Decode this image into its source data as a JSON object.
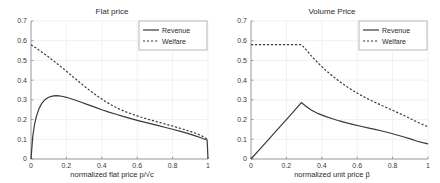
{
  "figure": {
    "background": "#ffffff",
    "line_color": "#3a3a3a",
    "grid_color": "#e8e8e8",
    "axis_color": "#8c8c8c"
  },
  "chart_data": [
    {
      "type": "line",
      "title": "Flat price",
      "xlabel": "normalized flat price p/√c",
      "ylabel": "",
      "xlim": [
        0,
        1
      ],
      "ylim": [
        0,
        0.7
      ],
      "xticks": [
        0,
        0.2,
        0.4,
        0.6,
        0.8,
        1
      ],
      "xticklabels": [
        "0",
        "0.2",
        "0.4",
        "0.6",
        "0.8",
        "1"
      ],
      "yticks": [
        0,
        0.1,
        0.2,
        0.3,
        0.4,
        0.5,
        0.6,
        0.7
      ],
      "yticklabels": [
        "0",
        "0.1",
        "0.2",
        "0.3",
        "0.4",
        "0.5",
        "0.6",
        "0.7"
      ],
      "grid": true,
      "legend_position": "upper right",
      "series": [
        {
          "name": "Revenue",
          "style": "solid",
          "x": [
            0.0,
            0.01,
            0.02,
            0.03,
            0.045,
            0.06,
            0.08,
            0.1,
            0.12,
            0.14,
            0.16,
            0.18,
            0.2,
            0.24,
            0.28,
            0.32,
            0.36,
            0.4,
            0.44,
            0.48,
            0.52,
            0.56,
            0.6,
            0.64,
            0.68,
            0.72,
            0.76,
            0.8,
            0.84,
            0.88,
            0.92,
            0.96,
            0.985,
            0.995,
            1.0
          ],
          "y": [
            0.0,
            0.115,
            0.175,
            0.215,
            0.255,
            0.281,
            0.302,
            0.313,
            0.319,
            0.321,
            0.32,
            0.317,
            0.313,
            0.302,
            0.289,
            0.276,
            0.263,
            0.25,
            0.238,
            0.227,
            0.216,
            0.206,
            0.196,
            0.187,
            0.178,
            0.169,
            0.16,
            0.151,
            0.141,
            0.131,
            0.12,
            0.108,
            0.099,
            0.097,
            0.0
          ]
        },
        {
          "name": "Welfare",
          "style": "dashed",
          "x": [
            0.0,
            0.02,
            0.04,
            0.06,
            0.08,
            0.1,
            0.14,
            0.18,
            0.22,
            0.26,
            0.3,
            0.34,
            0.38,
            0.42,
            0.46,
            0.5,
            0.54,
            0.58,
            0.62,
            0.66,
            0.7,
            0.74,
            0.78,
            0.82,
            0.86,
            0.9,
            0.94,
            0.97,
            1.0
          ],
          "y": [
            0.58,
            0.568,
            0.556,
            0.543,
            0.53,
            0.517,
            0.489,
            0.46,
            0.43,
            0.4,
            0.37,
            0.342,
            0.316,
            0.292,
            0.271,
            0.253,
            0.238,
            0.225,
            0.213,
            0.202,
            0.192,
            0.182,
            0.172,
            0.162,
            0.151,
            0.14,
            0.127,
            0.115,
            0.099
          ]
        }
      ]
    },
    {
      "type": "line",
      "title": "Volume Price",
      "xlabel": "normalized unit price β",
      "ylabel": "",
      "xlim": [
        0,
        1
      ],
      "ylim": [
        0,
        0.7
      ],
      "xticks": [
        0,
        0.2,
        0.4,
        0.6,
        0.8,
        1
      ],
      "xticklabels": [
        "0",
        "0.2",
        "0.4",
        "0.6",
        "0.8",
        "1"
      ],
      "yticks": [
        0,
        0.1,
        0.2,
        0.3,
        0.4,
        0.5,
        0.6,
        0.7
      ],
      "yticklabels": [
        "0",
        "0.1",
        "0.2",
        "0.3",
        "0.4",
        "0.5",
        "0.6",
        "0.7"
      ],
      "grid": true,
      "legend_position": "upper right",
      "series": [
        {
          "name": "Revenue",
          "style": "solid",
          "x": [
            0.0,
            0.05,
            0.1,
            0.15,
            0.2,
            0.25,
            0.285,
            0.31,
            0.34,
            0.38,
            0.42,
            0.46,
            0.5,
            0.54,
            0.58,
            0.62,
            0.66,
            0.7,
            0.74,
            0.78,
            0.82,
            0.86,
            0.9,
            0.94,
            0.97,
            1.0
          ],
          "y": [
            0.0,
            0.05,
            0.1,
            0.15,
            0.2,
            0.25,
            0.286,
            0.268,
            0.249,
            0.23,
            0.216,
            0.204,
            0.193,
            0.183,
            0.174,
            0.166,
            0.158,
            0.15,
            0.142,
            0.133,
            0.123,
            0.113,
            0.102,
            0.09,
            0.083,
            0.077
          ]
        },
        {
          "name": "Welfare",
          "style": "dashed",
          "x": [
            0.0,
            0.05,
            0.1,
            0.15,
            0.2,
            0.25,
            0.285,
            0.31,
            0.34,
            0.38,
            0.42,
            0.46,
            0.5,
            0.54,
            0.58,
            0.62,
            0.66,
            0.7,
            0.74,
            0.78,
            0.82,
            0.86,
            0.9,
            0.94,
            0.97,
            1.0
          ],
          "y": [
            0.58,
            0.58,
            0.58,
            0.58,
            0.58,
            0.58,
            0.58,
            0.556,
            0.524,
            0.486,
            0.452,
            0.421,
            0.393,
            0.368,
            0.345,
            0.324,
            0.305,
            0.288,
            0.271,
            0.255,
            0.239,
            0.222,
            0.205,
            0.187,
            0.175,
            0.163
          ]
        }
      ]
    }
  ]
}
